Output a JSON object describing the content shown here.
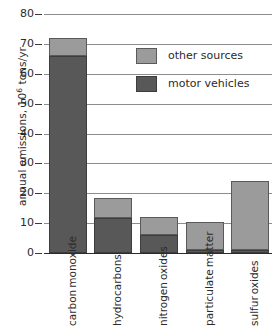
{
  "chart_data": {
    "type": "bar",
    "subtype": "stacked-vertical",
    "title": "",
    "xlabel": "",
    "ylabel": "annual emissions, 10^6 tons/yr",
    "ylabel_prefix": "annual emissions, 10",
    "ylabel_exponent": "6",
    "ylabel_suffix": " tons/yr",
    "ylim": [
      0,
      80
    ],
    "ytick_step": 10,
    "yticks": [
      0,
      10,
      20,
      30,
      40,
      50,
      60,
      70,
      80
    ],
    "ytick_labels": [
      "0",
      "10",
      "20",
      "30",
      "40",
      "50",
      "60",
      "70",
      "80"
    ],
    "grid": "horizontal",
    "legend_position": "upper-right-inside",
    "categories": [
      "carbon monoxide",
      "hydrocarbons",
      "nitrogen oxides",
      "particulate matter",
      "sulfur oxides"
    ],
    "category_lines": [
      [
        "carbon",
        "monoxide"
      ],
      [
        "hydrocarbons"
      ],
      [
        "nitrogen",
        "oxides"
      ],
      [
        "particulate",
        "matter"
      ],
      [
        "sulfur",
        "oxides"
      ]
    ],
    "series": [
      {
        "name": "motor vehicles",
        "color": "#585858",
        "values": [
          66.0,
          11.7,
          6.0,
          1.0,
          1.0
        ]
      },
      {
        "name": "other sources",
        "color": "#9b9b9b",
        "values": [
          6.0,
          6.8,
          6.0,
          9.3,
          23.0
        ]
      }
    ],
    "totals": [
      72.0,
      18.5,
      12.0,
      10.3,
      24.0
    ],
    "colors": {
      "other_sources": "#9b9b9b",
      "motor_vehicles": "#585858",
      "gridline": "#8d8d8d",
      "axis": "#2b2b2b",
      "background": "#ffffff"
    }
  },
  "legend": {
    "items": [
      {
        "label": "other sources",
        "key": "other"
      },
      {
        "label": "motor vehicles",
        "key": "motor"
      }
    ]
  }
}
